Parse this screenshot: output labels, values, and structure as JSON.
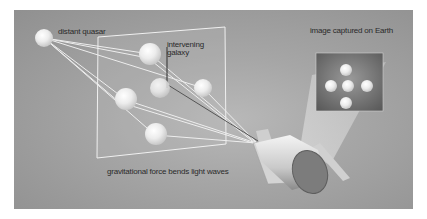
{
  "diagram": {
    "labels": {
      "distant_quasar": "distant quasar",
      "intervening_galaxy_line1": "intervening",
      "intervening_galaxy_line2": "galaxy",
      "image_captured": "image captured on Earth",
      "gravitational_force": "gravitational force bends light waves"
    },
    "colors": {
      "background": "#a6a6a6",
      "ray": "#f2f2f2",
      "text": "#2a2a2a",
      "frame": "#f0f0f0",
      "inset": "#6e6e6e"
    },
    "elements": [
      "distant-quasar",
      "lens-plane",
      "lensed-images",
      "intervening-galaxy",
      "telescope",
      "earth-image-inset"
    ]
  }
}
